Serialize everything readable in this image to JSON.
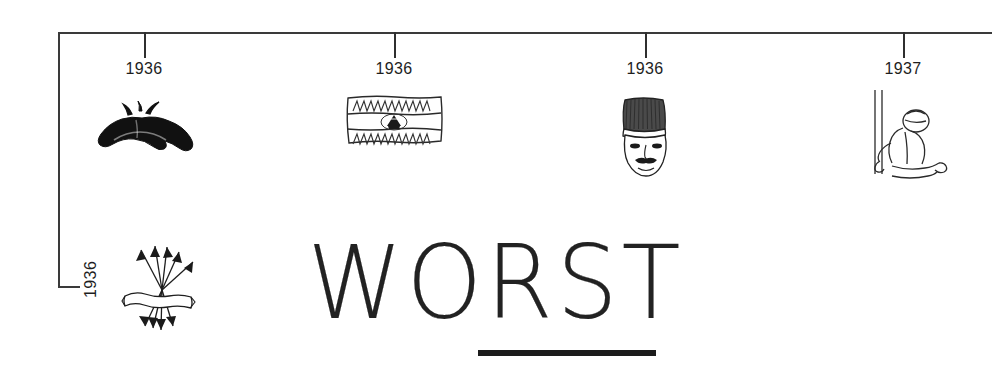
{
  "page": {
    "headline": "WORST",
    "background_color": "#ffffff",
    "ink_color": "#1e1e1e"
  },
  "timeline": {
    "axis": {
      "orientation": "horizontal-with-left-descender",
      "line_color": "#3a3a3a"
    },
    "events": [
      {
        "year": "1936",
        "tick_x": 144,
        "icon": "mustache-icon",
        "icon_label": "mustache"
      },
      {
        "year": "1936",
        "tick_x": 394,
        "icon": "flag-icon",
        "icon_label": "striped flag with triangular emblem"
      },
      {
        "year": "1936",
        "tick_x": 645,
        "icon": "fez-face-icon",
        "icon_label": "face wearing tall fez hat with mustache"
      },
      {
        "year": "1937",
        "tick_x": 903,
        "icon": "kneeling-figure-icon",
        "icon_label": "figure kneeling beside a post"
      }
    ],
    "branch_event": {
      "year": "1936",
      "rotation": "vertical",
      "icon": "arrows-bundle-icon",
      "icon_label": "bundle of arrows radiating from a scroll banner"
    }
  }
}
